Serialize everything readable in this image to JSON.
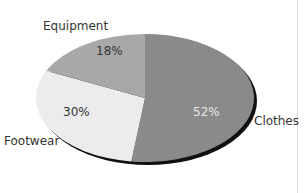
{
  "chart_data": {
    "type": "pie",
    "title": "",
    "categories": [
      "Clothes",
      "Footwear",
      "Equipment"
    ],
    "values": [
      52,
      30,
      18
    ],
    "value_labels": [
      "52%",
      "30%",
      "18%"
    ],
    "colors": [
      "#8a8a8a",
      "#ececec",
      "#a8a8a8"
    ],
    "start_angle_deg": 0,
    "direction": "clockwise",
    "shadow": true,
    "legend": "none (direct labels)"
  },
  "labels": {
    "clothes": "Clothes",
    "footwear": "Footwear",
    "equipment": "Equipment",
    "clothes_pct": "52%",
    "footwear_pct": "30%",
    "equipment_pct": "18%"
  },
  "style": {
    "shadow_color": "#111111",
    "clothes_pct_color": "#e6e6e6",
    "dark_pct_color": "#333333"
  }
}
